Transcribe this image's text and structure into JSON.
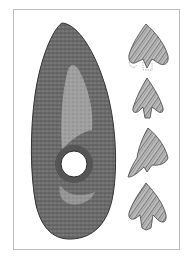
{
  "illustration": {
    "subject": "Perforated stone axe-hammer with four flint arrowheads",
    "main_object": "stone-axe-hammer",
    "secondary_objects": [
      "arrowhead-1",
      "arrowhead-2",
      "arrowhead-3",
      "arrowhead-4"
    ],
    "colors": {
      "background": "#ffffff",
      "frame": "#bdbdbd",
      "stone_dark": "#4a4a4a",
      "stone_mid": "#7a7a7a",
      "stone_light": "#b5b5b5",
      "flint_dark": "#555555",
      "flint_light": "#c8c8c8"
    }
  }
}
